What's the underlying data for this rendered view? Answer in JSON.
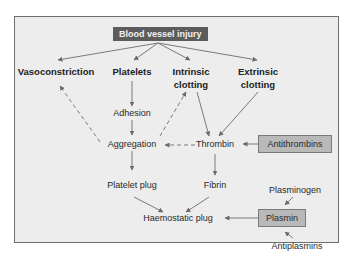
{
  "diagram": {
    "title_box": "Blood vessel injury",
    "nodes": {
      "vasoconstriction": "Vasoconstriction",
      "platelets": "Platelets",
      "intrinsic_line1": "Intrinsic",
      "intrinsic_line2": "clotting",
      "extrinsic_line1": "Extrinsic",
      "extrinsic_line2": "clotting",
      "adhesion": "Adhesion",
      "aggregation": "Aggregation",
      "thrombin": "Thrombin",
      "antithrombins": "Antithrombins",
      "platelet_plug": "Platelet plug",
      "fibrin": "Fibrin",
      "haemostatic_plug": "Haemostatic plug",
      "plasminogen": "Plasminogen",
      "plasmin": "Plasmin",
      "antiplasmins": "Antiplasmins"
    },
    "edges": [
      {
        "from": "Blood vessel injury",
        "to": "Vasoconstriction",
        "style": "solid"
      },
      {
        "from": "Blood vessel injury",
        "to": "Platelets",
        "style": "solid"
      },
      {
        "from": "Blood vessel injury",
        "to": "Intrinsic clotting",
        "style": "solid"
      },
      {
        "from": "Blood vessel injury",
        "to": "Extrinsic clotting",
        "style": "solid"
      },
      {
        "from": "Platelets",
        "to": "Adhesion",
        "style": "solid"
      },
      {
        "from": "Adhesion",
        "to": "Aggregation",
        "style": "solid"
      },
      {
        "from": "Aggregation",
        "to": "Vasoconstriction",
        "style": "dashed"
      },
      {
        "from": "Aggregation",
        "to": "Intrinsic clotting",
        "style": "dashed"
      },
      {
        "from": "Intrinsic clotting",
        "to": "Thrombin",
        "style": "solid"
      },
      {
        "from": "Extrinsic clotting",
        "to": "Thrombin",
        "style": "solid"
      },
      {
        "from": "Thrombin",
        "to": "Aggregation",
        "style": "dashed"
      },
      {
        "from": "Antithrombins",
        "to": "Thrombin",
        "style": "solid"
      },
      {
        "from": "Aggregation",
        "to": "Platelet plug",
        "style": "solid"
      },
      {
        "from": "Thrombin",
        "to": "Fibrin",
        "style": "solid"
      },
      {
        "from": "Platelet plug",
        "to": "Haemostatic plug",
        "style": "solid"
      },
      {
        "from": "Fibrin",
        "to": "Haemostatic plug",
        "style": "solid"
      },
      {
        "from": "Plasmin",
        "to": "Haemostatic plug",
        "style": "solid"
      },
      {
        "from": "Plasminogen",
        "to": "Plasmin",
        "style": "solid"
      },
      {
        "from": "Antiplasmins",
        "to": "Plasmin",
        "style": "solid"
      }
    ],
    "colors": {
      "frame_bg": "#ededed",
      "frame_border": "#6e6e6e",
      "dark_box": "#5c5c5c",
      "grey_box": "#b9b9b9",
      "arrow": "#6a6a6a"
    }
  }
}
